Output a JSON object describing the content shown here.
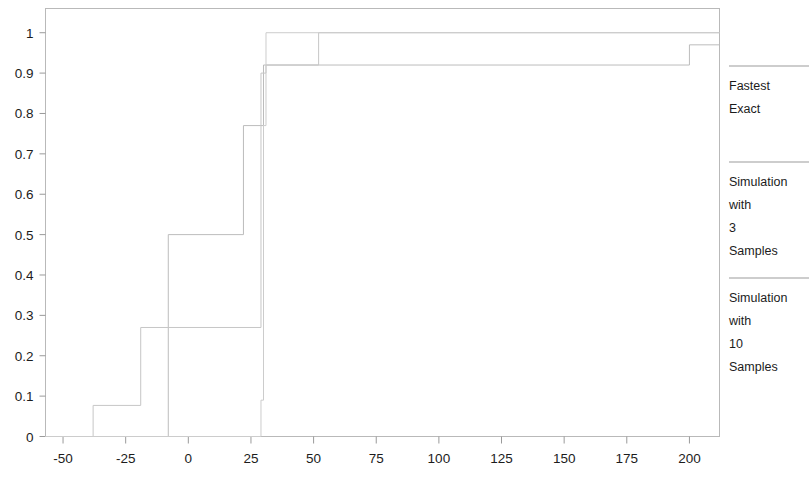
{
  "chart_data": {
    "type": "line",
    "subtype": "step-ecdf",
    "title": "",
    "xlabel": "",
    "ylabel": "",
    "xlim": [
      -57,
      212
    ],
    "ylim": [
      0,
      1.06
    ],
    "grid": false,
    "legend_position": "right",
    "x_ticks": [
      -50,
      -25,
      0,
      25,
      50,
      75,
      100,
      125,
      150,
      175,
      200
    ],
    "x_tick_labels": [
      "-50",
      "-25",
      "0",
      "25",
      "50",
      "75",
      "100",
      "125",
      "150",
      "175",
      "200"
    ],
    "y_ticks": [
      0,
      0.1,
      0.2,
      0.3,
      0.4,
      0.5,
      0.6,
      0.7,
      0.8,
      0.9,
      1
    ],
    "y_tick_labels": [
      "0",
      "0.1",
      "0.2",
      "0.3",
      "0.4",
      "0.5",
      "0.6",
      "0.7",
      "0.8",
      "0.9",
      "1"
    ],
    "series": [
      {
        "name": "Fastest Exact",
        "color": "#bcbcbc",
        "steps": [
          {
            "x": -57,
            "y": 0
          },
          {
            "x": -8,
            "y": 0
          },
          {
            "x": -8,
            "y": 0.5
          },
          {
            "x": 22,
            "y": 0.5
          },
          {
            "x": 22,
            "y": 0.77
          },
          {
            "x": 30,
            "y": 0.77
          },
          {
            "x": 30,
            "y": 0.92
          },
          {
            "x": 200,
            "y": 0.92
          },
          {
            "x": 200,
            "y": 0.97
          },
          {
            "x": 212,
            "y": 0.97
          }
        ]
      },
      {
        "name": "Simulation with 3 Samples",
        "color": "#c6c6c6",
        "steps": [
          {
            "x": -57,
            "y": 0
          },
          {
            "x": -38,
            "y": 0
          },
          {
            "x": -38,
            "y": 0.077
          },
          {
            "x": -19,
            "y": 0.077
          },
          {
            "x": -19,
            "y": 0.27
          },
          {
            "x": 29,
            "y": 0.27
          },
          {
            "x": 29,
            "y": 0.9
          },
          {
            "x": 31,
            "y": 0.9
          },
          {
            "x": 31,
            "y": 0.92
          },
          {
            "x": 52,
            "y": 0.92
          },
          {
            "x": 52,
            "y": 1.0
          },
          {
            "x": 212,
            "y": 1.0
          }
        ]
      },
      {
        "name": "Simulation with 10 Samples",
        "color": "#cccccc",
        "steps": [
          {
            "x": -57,
            "y": 0
          },
          {
            "x": 29,
            "y": 0
          },
          {
            "x": 29,
            "y": 0.09
          },
          {
            "x": 30,
            "y": 0.09
          },
          {
            "x": 30,
            "y": 0.77
          },
          {
            "x": 31,
            "y": 0.77
          },
          {
            "x": 31,
            "y": 1.0
          },
          {
            "x": 212,
            "y": 1.0
          }
        ]
      }
    ]
  },
  "legend": {
    "entries": [
      {
        "label_lines": [
          "Fastest",
          "Exact"
        ],
        "color": "#9b9b9b"
      },
      {
        "label_lines": [
          "Simulation",
          "with",
          "3",
          "Samples"
        ],
        "color": "#9b9b9b"
      },
      {
        "label_lines": [
          "Simulation",
          "with",
          "10",
          "Samples"
        ],
        "color": "#9b9b9b"
      }
    ]
  }
}
